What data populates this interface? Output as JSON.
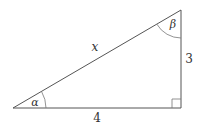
{
  "diagram": {
    "type": "right-triangle",
    "stroke_color": "#555555",
    "vertices": {
      "alpha_vertex": [
        13,
        108
      ],
      "right_angle_vertex": [
        181,
        108
      ],
      "beta_vertex": [
        181,
        10
      ]
    },
    "labels": {
      "hypotenuse": "x",
      "vertical_leg": "3",
      "horizontal_leg": "4",
      "angle_bottom_left": "α",
      "angle_top_right": "β"
    },
    "right_angle_marker": true
  }
}
